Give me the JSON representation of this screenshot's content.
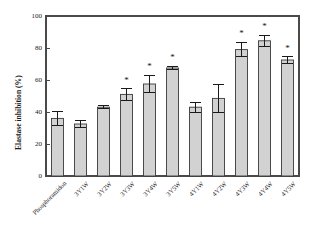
{
  "chart_data": {
    "type": "bar",
    "title": "",
    "xlabel": "",
    "ylabel": "Elastase inhibition (%)",
    "ylim": [
      0,
      100
    ],
    "yticks": [
      0,
      20,
      40,
      60,
      80,
      100
    ],
    "grid": false,
    "legend": "none",
    "bar_color": "#d2d2d2",
    "bar_edge_color": "#3a3a3a",
    "error_bar_color": "#1a1a1a",
    "significance_marker": "*",
    "categories": [
      "Phosphoramidon",
      "3Y1W",
      "3Y2W",
      "3Y3W",
      "3Y4W",
      "3Y5W",
      "4Y1W",
      "4Y2W",
      "4Y3W",
      "4Y4W",
      "4Y5W"
    ],
    "values": [
      36.0,
      32.5,
      43.0,
      51.0,
      57.5,
      67.5,
      43.0,
      48.5,
      79.0,
      84.5,
      72.5
    ],
    "errors": [
      4.5,
      2.0,
      1.0,
      3.5,
      5.5,
      1.0,
      3.0,
      8.5,
      4.5,
      3.5,
      2.0
    ],
    "significant": [
      false,
      false,
      false,
      true,
      true,
      true,
      false,
      false,
      true,
      true,
      true
    ]
  }
}
